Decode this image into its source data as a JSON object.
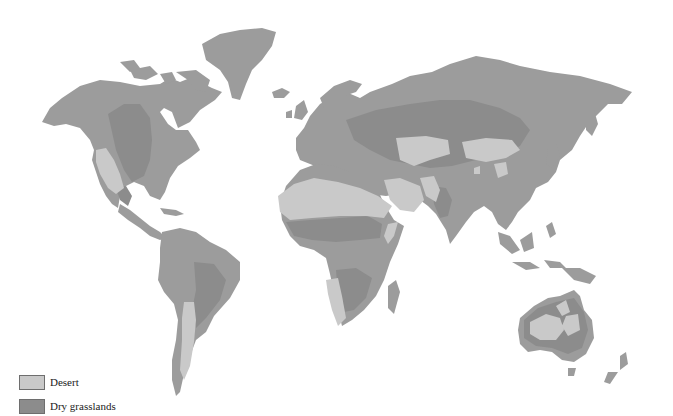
{
  "map": {
    "title": "",
    "colors": {
      "background": "#ffffff",
      "land": "#9c9c9c",
      "desert": "#c9c9c9",
      "dry_grasslands": "#8c8c8c"
    }
  },
  "legend": {
    "items": [
      {
        "label": "Desert",
        "color": "#c9c9c9"
      },
      {
        "label": "Dry grasslands",
        "color": "#8c8c8c"
      }
    ]
  }
}
